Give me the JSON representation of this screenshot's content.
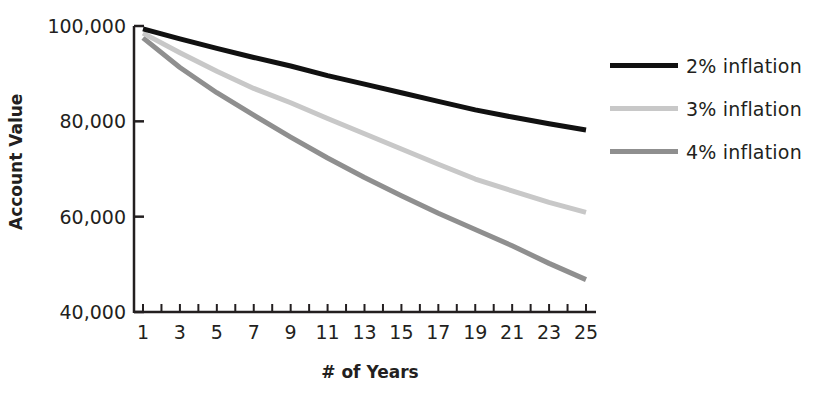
{
  "chart_data": {
    "type": "line",
    "title": "",
    "xlabel": "# of Years",
    "ylabel": "Account Value",
    "x": [
      1,
      3,
      5,
      7,
      9,
      11,
      13,
      15,
      17,
      19,
      21,
      23,
      25
    ],
    "xticks": [
      1,
      3,
      5,
      7,
      9,
      11,
      13,
      15,
      17,
      19,
      21,
      23,
      25
    ],
    "ylim": [
      40000,
      100000
    ],
    "yticks": [
      40000,
      60000,
      80000,
      100000
    ],
    "ytick_labels": [
      "40,000",
      "60,000",
      "80,000",
      "100,000"
    ],
    "grid": false,
    "legend_position": "right",
    "series": [
      {
        "name": "2% inflation",
        "color": "#111111",
        "values": [
          99400,
          97300,
          95300,
          93400,
          91600,
          89600,
          87800,
          86000,
          84200,
          82400,
          80900,
          79500,
          78200
        ]
      },
      {
        "name": "3% inflation",
        "color": "#c8c8c8",
        "values": [
          98500,
          94400,
          90500,
          86900,
          83900,
          80600,
          77400,
          74200,
          71000,
          67900,
          65400,
          63000,
          60900
        ]
      },
      {
        "name": "4% inflation",
        "color": "#8f8f8f",
        "values": [
          97500,
          91300,
          86000,
          81300,
          76700,
          72300,
          68200,
          64400,
          60700,
          57300,
          53900,
          50200,
          46800
        ]
      }
    ]
  },
  "legend": {
    "items": [
      {
        "label": "2% inflation",
        "color": "#111111"
      },
      {
        "label": "3% inflation",
        "color": "#c8c8c8"
      },
      {
        "label": "4% inflation",
        "color": "#8f8f8f"
      }
    ]
  },
  "axes": {
    "xlabel": "# of Years",
    "ylabel": "Account Value"
  }
}
